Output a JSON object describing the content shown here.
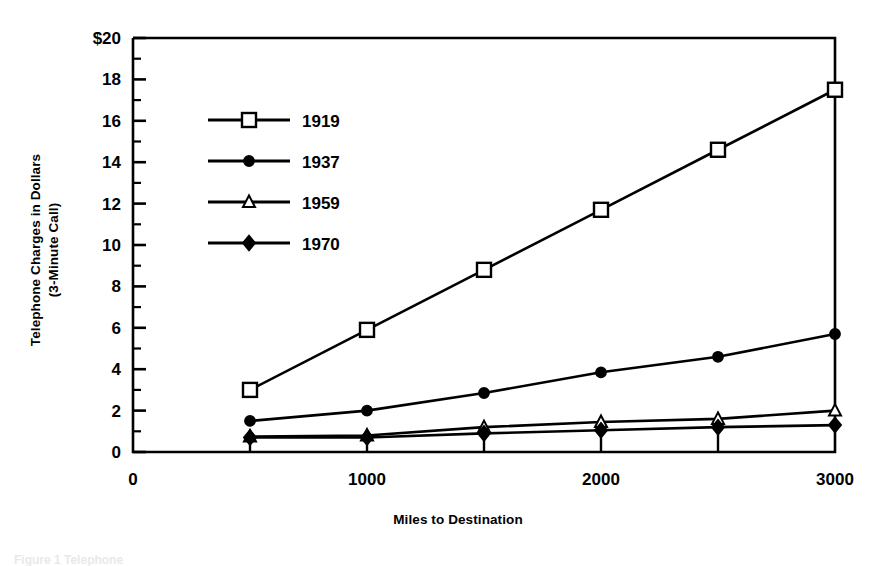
{
  "figure": {
    "background_color": "#ffffff",
    "ink_color": "#000000"
  },
  "chart_data": {
    "type": "line",
    "title": "",
    "xlabel": "Miles to Destination",
    "ylabel": "Telephone Charges in Dollars\n(3-Minute Call)",
    "ylabel_line1": "Telephone Charges in Dollars",
    "ylabel_line2": "(3-Minute Call)",
    "x": [
      500,
      1000,
      1500,
      2000,
      2500,
      3000
    ],
    "xlim": [
      0,
      3000
    ],
    "ylim": [
      0,
      20
    ],
    "xticks": [
      0,
      500,
      1000,
      1500,
      2000,
      2500,
      3000
    ],
    "xtick_labels": [
      "0",
      "",
      "1000",
      "",
      "2000",
      "",
      "3000"
    ],
    "xtick_major_labels": [
      "0",
      "1000",
      "2000",
      "3000"
    ],
    "yticks": [
      0,
      2,
      4,
      6,
      8,
      10,
      12,
      14,
      16,
      18,
      20
    ],
    "ytick_labels": [
      "0",
      "2",
      "4",
      "6",
      "8",
      "10",
      "12",
      "14",
      "16",
      "18",
      "$20"
    ],
    "yminor_step": 1,
    "grid": false,
    "legend_position": "upper-left-inside",
    "series": [
      {
        "name": "1919",
        "marker": "open-square",
        "values": [
          3.0,
          5.9,
          8.8,
          11.7,
          14.6,
          17.5
        ]
      },
      {
        "name": "1937",
        "marker": "filled-circle",
        "values": [
          1.5,
          2.0,
          2.85,
          3.85,
          4.6,
          5.7
        ]
      },
      {
        "name": "1959",
        "marker": "open-triangle",
        "values": [
          0.75,
          0.8,
          1.2,
          1.45,
          1.6,
          2.0
        ]
      },
      {
        "name": "1970",
        "marker": "filled-diamond",
        "values": [
          0.7,
          0.7,
          0.9,
          1.05,
          1.2,
          1.3
        ]
      }
    ]
  },
  "legend": {
    "entries": [
      {
        "label": "1919",
        "marker": "open-square"
      },
      {
        "label": "1937",
        "marker": "filled-circle"
      },
      {
        "label": "1959",
        "marker": "open-triangle"
      },
      {
        "label": "1970",
        "marker": "filled-diamond"
      }
    ]
  },
  "caption": {
    "text": "Figure 1 Telephone"
  }
}
